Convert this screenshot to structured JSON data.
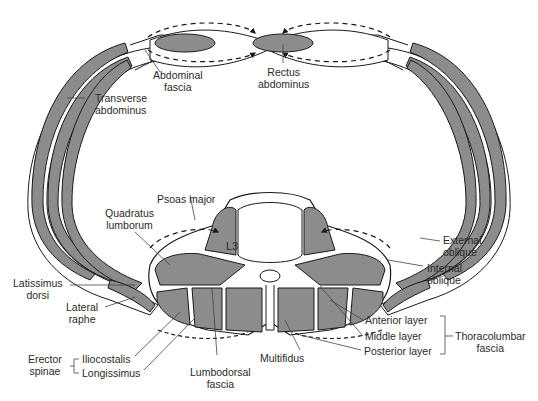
{
  "diagram": {
    "colors": {
      "muscle": "#8c8c8c",
      "outline": "#1a1a1a",
      "background": "#ffffff",
      "text": "#2a2a2a"
    },
    "vertebra": {
      "label": "L3"
    },
    "labels": {
      "abdominal_fascia": {
        "line1": "Abdominal",
        "line2": "fascia"
      },
      "rectus_abdominus": {
        "line1": "Rectus",
        "line2": "abdominus"
      },
      "transverse_abdominus": {
        "line1": "Transverse",
        "line2": "abdominus"
      },
      "psoas_major": {
        "line1": "Psoas major"
      },
      "quadratus_lumborum": {
        "line1": "Quadratus",
        "line2": "lumborum"
      },
      "external_oblique": {
        "line1": "External",
        "line2": "oblique"
      },
      "internal_oblique": {
        "line1": "Internal",
        "line2": "oblique"
      },
      "latissimus_dorsi": {
        "line1": "Latissimus",
        "line2": "dorsi"
      },
      "lateral_raphe": {
        "line1": "Lateral",
        "line2": "raphe"
      },
      "erector_spinae": {
        "line1": "Erector",
        "line2": "spinae"
      },
      "iliocostalis": {
        "line1": "Iliocostalis"
      },
      "longissimus": {
        "line1": "Longissimus"
      },
      "lumbodorsal_fascia": {
        "line1": "Lumbodorsal",
        "line2": "fascia"
      },
      "multifidus": {
        "line1": "Multifidus"
      },
      "anterior_layer": {
        "line1": "Anterior layer"
      },
      "middle_layer": {
        "line1": "Middle layer"
      },
      "posterior_layer": {
        "line1": "Posterior layer"
      },
      "thoracolumbar_fascia": {
        "line1": "Thoracolumbar",
        "line2": "fascia"
      }
    }
  }
}
